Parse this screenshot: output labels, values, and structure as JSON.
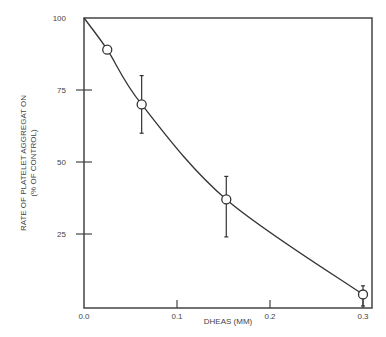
{
  "chart_data": {
    "type": "line",
    "title": "",
    "xlabel": "DHEAS (MM)",
    "ylabel_line1": "RATE OF PLATELET AGGREGAT ON",
    "ylabel_line2": "(% OF CONTROL)",
    "xlim": [
      0.0,
      0.31
    ],
    "ylim": [
      0,
      100
    ],
    "x_ticks": [
      {
        "value": 0.0,
        "label": "0.0"
      },
      {
        "value": 0.1,
        "label": "0.1"
      },
      {
        "value": 0.2,
        "label": "0.2"
      },
      {
        "value": 0.3,
        "label": "0.3"
      }
    ],
    "y_ticks": [
      {
        "value": 25,
        "label": "25"
      },
      {
        "value": 50,
        "label": "50"
      },
      {
        "value": 75,
        "label": "75"
      },
      {
        "value": 100,
        "label": "100"
      }
    ],
    "grid": false,
    "curve_start": {
      "x": 0.0,
      "y": 100
    },
    "series": [
      {
        "name": "Platelet aggregation",
        "points": [
          {
            "x": 0.025,
            "y": 89,
            "err_low": null,
            "err_high": null
          },
          {
            "x": 0.062,
            "y": 70,
            "err_low": 60,
            "err_high": 80
          },
          {
            "x": 0.153,
            "y": 37,
            "err_low": 24,
            "err_high": 45
          },
          {
            "x": 0.3,
            "y": 4,
            "err_low": 0,
            "err_high": 7
          }
        ]
      }
    ]
  },
  "colors": {
    "axis": "#444444",
    "line": "#333333",
    "marker_fill": "#ffffff"
  }
}
